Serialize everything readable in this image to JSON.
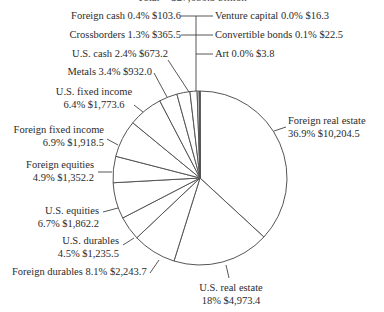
{
  "chart_data": {
    "type": "pie",
    "title": "Total = $27,680.5 billion",
    "title_clipped": true,
    "start_angle": "12 o'clock",
    "direction": "clockwise",
    "slices": [
      {
        "name": "Foreign real estate",
        "percent": 36.9,
        "value": 10204.5,
        "label": "36.9%  $10,204.5"
      },
      {
        "name": "U.S. real estate",
        "percent": 18.0,
        "value": 4973.4,
        "label": "18%  $4,973.4"
      },
      {
        "name": "Foreign durables",
        "percent": 8.1,
        "value": 2243.7,
        "label": "8.1%  $2,243.7"
      },
      {
        "name": "U.S. durables",
        "percent": 4.5,
        "value": 1235.5,
        "label": "4.5%  $1,235.5"
      },
      {
        "name": "U.S. equities",
        "percent": 6.7,
        "value": 1862.2,
        "label": "6.7%  $1,862.2"
      },
      {
        "name": "Foreign equities",
        "percent": 4.9,
        "value": 1352.2,
        "label": "4.9%  $1,352.2"
      },
      {
        "name": "Foreign fixed income",
        "percent": 6.9,
        "value": 1918.5,
        "label": "6.9%  $1,918.5"
      },
      {
        "name": "U.S. fixed income",
        "percent": 6.4,
        "value": 1773.6,
        "label": "6.4%  $1,773.6"
      },
      {
        "name": "Metals",
        "percent": 3.4,
        "value": 932.0,
        "label": "3.4%  $932.0"
      },
      {
        "name": "U.S. cash",
        "percent": 2.4,
        "value": 673.2,
        "label": "2.4%  $673.2"
      },
      {
        "name": "Crossborders",
        "percent": 1.3,
        "value": 365.5,
        "label": "1.3%  $365.5"
      },
      {
        "name": "Foreign cash",
        "percent": 0.4,
        "value": 103.6,
        "label": "0.4%  $103.6"
      },
      {
        "name": "Venture capital",
        "percent": 0.0,
        "value": 16.3,
        "label": "0.0%  $16.3"
      },
      {
        "name": "Convertible bonds",
        "percent": 0.1,
        "value": 22.5,
        "label": "0.1%  $22.5"
      },
      {
        "name": "Art",
        "percent": 0.0,
        "value": 3.8,
        "label": "0.0%  $3.8"
      }
    ],
    "legend": "none (direct labels with leader lines)",
    "colors": {
      "fill": "#ffffff",
      "stroke": "#555555"
    }
  },
  "labels": {
    "foreign_cash": "Foreign cash 0.4%  $103.6",
    "venture_capital": "Venture capital 0.0%  $16.3",
    "crossborders": "Crossborders 1.3%  $365.5",
    "convertible_bonds": "Convertible bonds 0.1%  $22.5",
    "us_cash": "U.S. cash 2.4%  $673.2",
    "art": "Art 0.0%  $3.8",
    "metals": "Metals 3.4%  $932.0",
    "us_fixed_income_1": "U.S. fixed income",
    "us_fixed_income_2": "6.4%  $1,773.6",
    "foreign_fixed_income_1": "Foreign fixed income",
    "foreign_fixed_income_2": "6.9%  $1,918.5",
    "foreign_equities_1": "Foreign equities",
    "foreign_equities_2": "4.9%  $1,352.2",
    "us_equities_1": "U.S. equities",
    "us_equities_2": "6.7%  $1,862.2",
    "us_durables_1": "U.S. durables",
    "us_durables_2": "4.5%  $1,235.5",
    "foreign_durables": "Foreign durables 8.1%  $2,243.7",
    "us_real_estate_1": "U.S. real estate",
    "us_real_estate_2": "18%  $4,973.4",
    "foreign_real_estate_1": "Foreign real estate",
    "foreign_real_estate_2": "36.9%  $10,204.5"
  }
}
